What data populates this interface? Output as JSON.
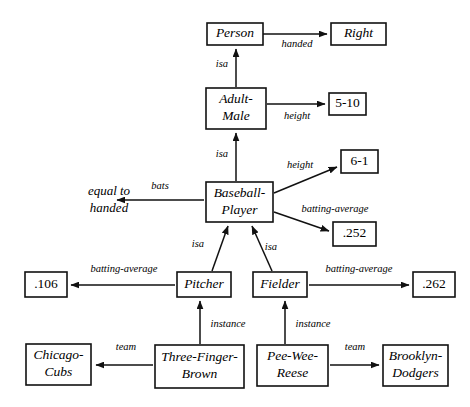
{
  "diagram": {
    "style": {
      "background": "#ffffff",
      "stroke": "#111111",
      "text": "#000000",
      "node_fill": "#ffffff"
    },
    "nodes": [
      {
        "id": "person",
        "label": "Person",
        "lines": [
          "Person"
        ],
        "boxed": true,
        "italic": true,
        "x": 207,
        "y": 23,
        "w": 56,
        "h": 22
      },
      {
        "id": "right",
        "label": "Right",
        "lines": [
          "Right"
        ],
        "boxed": true,
        "italic": true,
        "x": 331,
        "y": 23,
        "w": 55,
        "h": 22
      },
      {
        "id": "adult-male",
        "label": "Adult-Male",
        "lines": [
          "Adult-",
          "Male"
        ],
        "boxed": true,
        "italic": true,
        "x": 206,
        "y": 88,
        "w": 60,
        "h": 41
      },
      {
        "id": "height-5-10",
        "label": "5-10",
        "lines": [
          "5-10"
        ],
        "boxed": true,
        "italic": false,
        "x": 329,
        "y": 93,
        "w": 37,
        "h": 22
      },
      {
        "id": "baseball-player",
        "label": "Baseball-Player",
        "lines": [
          "Baseball-",
          "Player"
        ],
        "boxed": true,
        "italic": true,
        "x": 206,
        "y": 182,
        "w": 67,
        "h": 40
      },
      {
        "id": "height-6-1",
        "label": "6-1",
        "lines": [
          "6-1"
        ],
        "boxed": true,
        "italic": false,
        "x": 341,
        "y": 150,
        "w": 37,
        "h": 23
      },
      {
        "id": "avg-252",
        "label": ".252",
        "lines": [
          ".252"
        ],
        "boxed": true,
        "italic": false,
        "x": 333,
        "y": 222,
        "w": 43,
        "h": 24
      },
      {
        "id": "equal-to-handed",
        "label": "equal to handed",
        "lines": [
          "equal to",
          "handed"
        ],
        "boxed": false,
        "italic": true,
        "x": 70,
        "y": 184,
        "w": 78,
        "h": 34
      },
      {
        "id": "pitcher",
        "label": "Pitcher",
        "lines": [
          "Pitcher"
        ],
        "boxed": true,
        "italic": true,
        "x": 177,
        "y": 272,
        "w": 54,
        "h": 25
      },
      {
        "id": "fielder",
        "label": "Fielder",
        "lines": [
          "Fielder"
        ],
        "boxed": true,
        "italic": true,
        "x": 253,
        "y": 272,
        "w": 54,
        "h": 25
      },
      {
        "id": "avg-106",
        "label": ".106",
        "lines": [
          ".106"
        ],
        "boxed": true,
        "italic": false,
        "x": 25,
        "y": 272,
        "w": 42,
        "h": 25
      },
      {
        "id": "avg-262",
        "label": ".262",
        "lines": [
          ".262"
        ],
        "boxed": true,
        "italic": false,
        "x": 413,
        "y": 272,
        "w": 42,
        "h": 25
      },
      {
        "id": "chicago-cubs",
        "label": "Chicago-Cubs",
        "lines": [
          "Chicago-",
          "Cubs"
        ],
        "boxed": true,
        "italic": true,
        "x": 26,
        "y": 344,
        "w": 65,
        "h": 41
      },
      {
        "id": "three-finger",
        "label": "Three-Finger-Brown",
        "lines": [
          "Three-Finger-",
          "Brown"
        ],
        "boxed": true,
        "italic": true,
        "x": 155,
        "y": 345,
        "w": 89,
        "h": 43
      },
      {
        "id": "pee-wee-reese",
        "label": "Pee-Wee-Reese",
        "lines": [
          "Pee-Wee-",
          "Reese"
        ],
        "boxed": true,
        "italic": true,
        "x": 257,
        "y": 345,
        "w": 71,
        "h": 41
      },
      {
        "id": "brooklyn-dodgers",
        "label": "Brooklyn-Dodgers",
        "lines": [
          "Brooklyn-",
          "Dodgers"
        ],
        "boxed": true,
        "italic": true,
        "x": 383,
        "y": 345,
        "w": 65,
        "h": 41
      }
    ],
    "edges": [
      {
        "id": "person-handed-right",
        "from": "person",
        "to": "right",
        "label": "handed",
        "label_x": 297,
        "label_y": 45,
        "x1": 263,
        "y1": 34,
        "x2": 327,
        "y2": 34,
        "arrow": true
      },
      {
        "id": "adultmale-isa-person",
        "from": "adult-male",
        "to": "person",
        "label": "isa",
        "label_x": 222,
        "label_y": 65,
        "x1": 236,
        "y1": 87,
        "x2": 236,
        "y2": 49,
        "arrow": true
      },
      {
        "id": "adultmale-height-510",
        "from": "adult-male",
        "to": "height-5-10",
        "label": "height",
        "label_x": 297,
        "label_y": 117,
        "x1": 267,
        "y1": 104,
        "x2": 325,
        "y2": 104,
        "arrow": true
      },
      {
        "id": "player-isa-adultmale",
        "from": "baseball-player",
        "to": "adult-male",
        "label": "isa",
        "label_x": 222,
        "label_y": 155,
        "x1": 236,
        "y1": 181,
        "x2": 236,
        "y2": 133,
        "arrow": true
      },
      {
        "id": "player-height-61",
        "from": "baseball-player",
        "to": "height-6-1",
        "label": "height",
        "label_x": 300,
        "label_y": 166,
        "x1": 274,
        "y1": 193,
        "x2": 337,
        "y2": 167,
        "arrow": true
      },
      {
        "id": "player-bats-equalhanded",
        "from": "baseball-player",
        "to": "equal-to-handed",
        "label": "bats",
        "label_x": 160,
        "label_y": 187,
        "x1": 204,
        "y1": 200,
        "x2": 117,
        "y2": 200,
        "arrow": true
      },
      {
        "id": "player-battingavg-252",
        "from": "baseball-player",
        "to": "avg-252",
        "label": "batting-average",
        "label_x": 335,
        "label_y": 210,
        "x1": 274,
        "y1": 212,
        "x2": 329,
        "y2": 231,
        "arrow": true
      },
      {
        "id": "pitcher-isa-player",
        "from": "pitcher",
        "to": "baseball-player",
        "label": "isa",
        "label_x": 198,
        "label_y": 245,
        "x1": 212,
        "y1": 271,
        "x2": 228,
        "y2": 226,
        "arrow": true
      },
      {
        "id": "fielder-isa-player",
        "from": "fielder",
        "to": "baseball-player",
        "label": "isa",
        "label_x": 271,
        "label_y": 248,
        "x1": 272,
        "y1": 271,
        "x2": 252,
        "y2": 226,
        "arrow": true
      },
      {
        "id": "pitcher-battingavg-106",
        "from": "pitcher",
        "to": "avg-106",
        "label": "batting-average",
        "label_x": 124,
        "label_y": 270,
        "x1": 175,
        "y1": 285,
        "x2": 71,
        "y2": 285,
        "arrow": true
      },
      {
        "id": "fielder-battingavg-262",
        "from": "fielder",
        "to": "avg-262",
        "label": "batting-average",
        "label_x": 359,
        "label_y": 270,
        "x1": 309,
        "y1": 285,
        "x2": 409,
        "y2": 285,
        "arrow": true
      },
      {
        "id": "brown-instance-pitcher",
        "from": "three-finger",
        "to": "pitcher",
        "label": "instance",
        "label_x": 228,
        "label_y": 325,
        "x1": 200,
        "y1": 344,
        "x2": 200,
        "y2": 301,
        "arrow": true
      },
      {
        "id": "reese-instance-fielder",
        "from": "pee-wee-reese",
        "to": "fielder",
        "label": "instance",
        "label_x": 313,
        "label_y": 325,
        "x1": 285,
        "y1": 344,
        "x2": 285,
        "y2": 301,
        "arrow": true
      },
      {
        "id": "brown-team-cubs",
        "from": "three-finger",
        "to": "chicago-cubs",
        "label": "team",
        "label_x": 126,
        "label_y": 348,
        "x1": 153,
        "y1": 365,
        "x2": 96,
        "y2": 365,
        "arrow": true
      },
      {
        "id": "reese-team-dodgers",
        "from": "pee-wee-reese",
        "to": "brooklyn-dodgers",
        "label": "team",
        "label_x": 355,
        "label_y": 348,
        "x1": 330,
        "y1": 365,
        "x2": 379,
        "y2": 365,
        "arrow": true
      }
    ]
  }
}
